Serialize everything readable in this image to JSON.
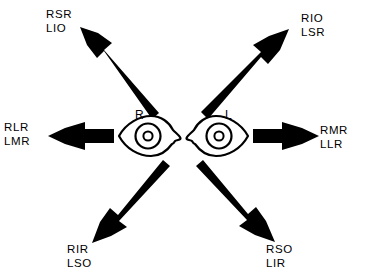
{
  "diagram": {
    "background_color": "#ffffff",
    "ink_color": "#000000",
    "eyes": [
      {
        "id": "right-eye",
        "letter": "R",
        "side": "right"
      },
      {
        "id": "left-eye",
        "letter": "L",
        "side": "left"
      }
    ],
    "gaze_labels": [
      {
        "id": "upper-left",
        "direction": "up-and-right-gaze",
        "line1": "RSR",
        "line2": "LIO"
      },
      {
        "id": "upper-right",
        "direction": "up-and-left-gaze",
        "line1": "RIO",
        "line2": "LSR"
      },
      {
        "id": "left",
        "direction": "right-gaze",
        "line1": "RLR",
        "line2": "LMR"
      },
      {
        "id": "right",
        "direction": "left-gaze",
        "line1": "RMR",
        "line2": "LLR"
      },
      {
        "id": "lower-left",
        "direction": "down-and-right-gaze",
        "line1": "RIR",
        "line2": "LSO"
      },
      {
        "id": "lower-right",
        "direction": "down-and-left-gaze",
        "line1": "RSO",
        "line2": "LIR"
      }
    ],
    "arrows": [
      {
        "id": "arrow-upper-left",
        "from": "right-eye",
        "points_to": "upper-left"
      },
      {
        "id": "arrow-upper-right",
        "from": "left-eye",
        "points_to": "upper-right"
      },
      {
        "id": "arrow-left",
        "from": "right-eye",
        "points_to": "left"
      },
      {
        "id": "arrow-right",
        "from": "left-eye",
        "points_to": "right"
      },
      {
        "id": "arrow-lower-left",
        "from": "right-eye",
        "points_to": "lower-left"
      },
      {
        "id": "arrow-lower-right",
        "from": "left-eye",
        "points_to": "lower-right"
      }
    ]
  }
}
